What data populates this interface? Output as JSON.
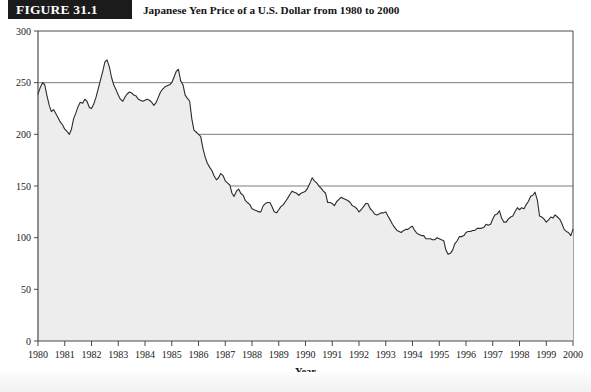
{
  "figure": {
    "label": "FIGURE 31.1",
    "title": "Japanese Yen Price of a U.S. Dollar from 1980 to 2000",
    "label_band_color": "#1b1b1b",
    "label_text_color": "#ffffff"
  },
  "chart_data": {
    "type": "area",
    "title": "Japanese Yen Price of a U.S. Dollar from 1980 to 2000",
    "xlabel": "Year",
    "ylabel": "",
    "xlim": [
      1980,
      2000
    ],
    "ylim": [
      0,
      300
    ],
    "grid": true,
    "gridlines_y": [
      50,
      100,
      150,
      200,
      250
    ],
    "legend": "none",
    "line_color": "#2b2b2b",
    "fill_color": "#ededed",
    "axis_color": "#4a4a4a",
    "yticks": [
      0,
      50,
      100,
      150,
      200,
      250,
      300
    ],
    "ytick_labels": [
      "0",
      "50",
      "100",
      "150",
      "200",
      "250",
      "300"
    ],
    "xticks": [
      1980,
      1981,
      1982,
      1983,
      1984,
      1985,
      1986,
      1987,
      1988,
      1989,
      1990,
      1991,
      1992,
      1993,
      1994,
      1995,
      1996,
      1997,
      1998,
      1999,
      2000
    ],
    "xtick_labels": [
      "1980",
      "1981",
      "1982",
      "1983",
      "1984",
      "1985",
      "1986",
      "1987",
      "1988",
      "1989",
      "1990",
      "1991",
      "1992",
      "1993",
      "1994",
      "1995",
      "1996",
      "1997",
      "1998",
      "1999",
      "2000"
    ],
    "series_name": "Yen per U.S. Dollar",
    "x": [
      1980.0,
      1980.08,
      1980.17,
      1980.25,
      1980.33,
      1980.42,
      1980.5,
      1980.58,
      1980.67,
      1980.75,
      1980.83,
      1980.92,
      1981.0,
      1981.08,
      1981.17,
      1981.25,
      1981.33,
      1981.42,
      1981.5,
      1981.58,
      1981.67,
      1981.75,
      1981.83,
      1981.92,
      1982.0,
      1982.08,
      1982.17,
      1982.25,
      1982.33,
      1982.42,
      1982.5,
      1982.58,
      1982.67,
      1982.75,
      1982.83,
      1982.92,
      1983.0,
      1983.08,
      1983.17,
      1983.25,
      1983.33,
      1983.42,
      1983.5,
      1983.58,
      1983.67,
      1983.75,
      1983.83,
      1983.92,
      1984.0,
      1984.08,
      1984.17,
      1984.25,
      1984.33,
      1984.42,
      1984.5,
      1984.58,
      1984.67,
      1984.75,
      1984.83,
      1984.92,
      1985.0,
      1985.08,
      1985.17,
      1985.25,
      1985.33,
      1985.42,
      1985.5,
      1985.58,
      1985.67,
      1985.75,
      1985.83,
      1985.92,
      1986.0,
      1986.08,
      1986.17,
      1986.25,
      1986.33,
      1986.42,
      1986.5,
      1986.58,
      1986.67,
      1986.75,
      1986.83,
      1986.92,
      1987.0,
      1987.08,
      1987.17,
      1987.25,
      1987.33,
      1987.42,
      1987.5,
      1987.58,
      1987.67,
      1987.75,
      1987.83,
      1987.92,
      1988.0,
      1988.08,
      1988.17,
      1988.25,
      1988.33,
      1988.42,
      1988.5,
      1988.58,
      1988.67,
      1988.75,
      1988.83,
      1988.92,
      1989.0,
      1989.08,
      1989.17,
      1989.25,
      1989.33,
      1989.42,
      1989.5,
      1989.58,
      1989.67,
      1989.75,
      1989.83,
      1989.92,
      1990.0,
      1990.08,
      1990.17,
      1990.25,
      1990.33,
      1990.42,
      1990.5,
      1990.58,
      1990.67,
      1990.75,
      1990.83,
      1990.92,
      1991.0,
      1991.08,
      1991.17,
      1991.25,
      1991.33,
      1991.42,
      1991.5,
      1991.58,
      1991.67,
      1991.75,
      1991.83,
      1991.92,
      1992.0,
      1992.08,
      1992.17,
      1992.25,
      1992.33,
      1992.42,
      1992.5,
      1992.58,
      1992.67,
      1992.75,
      1992.83,
      1992.92,
      1993.0,
      1993.08,
      1993.17,
      1993.25,
      1993.33,
      1993.42,
      1993.5,
      1993.58,
      1993.67,
      1993.75,
      1993.83,
      1993.92,
      1994.0,
      1994.08,
      1994.17,
      1994.25,
      1994.33,
      1994.42,
      1994.5,
      1994.58,
      1994.67,
      1994.75,
      1994.83,
      1994.92,
      1995.0,
      1995.08,
      1995.17,
      1995.25,
      1995.33,
      1995.42,
      1995.5,
      1995.58,
      1995.67,
      1995.75,
      1995.83,
      1995.92,
      1996.0,
      1996.08,
      1996.17,
      1996.25,
      1996.33,
      1996.42,
      1996.5,
      1996.58,
      1996.67,
      1996.75,
      1996.83,
      1996.92,
      1997.0,
      1997.08,
      1997.17,
      1997.25,
      1997.33,
      1997.42,
      1997.5,
      1997.58,
      1997.67,
      1997.75,
      1997.83,
      1997.92,
      1998.0,
      1998.08,
      1998.17,
      1998.25,
      1998.33,
      1998.42,
      1998.5,
      1998.58,
      1998.67,
      1998.75,
      1998.83,
      1998.92,
      1999.0,
      1999.08,
      1999.17,
      1999.25,
      1999.33,
      1999.42,
      1999.5,
      1999.58,
      1999.67,
      1999.75,
      1999.83,
      1999.92,
      2000.0
    ],
    "values": [
      239,
      245,
      250,
      248,
      238,
      228,
      222,
      224,
      220,
      216,
      212,
      209,
      205,
      203,
      200,
      205,
      215,
      221,
      227,
      231,
      230,
      234,
      232,
      226,
      225,
      229,
      236,
      244,
      252,
      261,
      270,
      272,
      265,
      255,
      248,
      243,
      238,
      234,
      232,
      236,
      239,
      241,
      240,
      238,
      237,
      234,
      233,
      232,
      233,
      234,
      233,
      231,
      228,
      231,
      236,
      241,
      244,
      246,
      247,
      248,
      250,
      255,
      261,
      263,
      252,
      248,
      238,
      235,
      232,
      215,
      204,
      202,
      200,
      198,
      186,
      178,
      172,
      168,
      165,
      160,
      156,
      158,
      162,
      160,
      155,
      153,
      151,
      143,
      140,
      145,
      147,
      143,
      141,
      136,
      134,
      132,
      128,
      127,
      126,
      125,
      125,
      131,
      133,
      134,
      134,
      130,
      125,
      124,
      127,
      130,
      132,
      135,
      138,
      142,
      145,
      144,
      143,
      141,
      143,
      144,
      145,
      148,
      153,
      158,
      155,
      153,
      150,
      148,
      145,
      143,
      134,
      134,
      133,
      131,
      135,
      137,
      139,
      138,
      137,
      136,
      134,
      131,
      130,
      128,
      125,
      127,
      130,
      133,
      133,
      128,
      126,
      123,
      122,
      123,
      124,
      124,
      125,
      121,
      117,
      113,
      110,
      107,
      106,
      105,
      107,
      108,
      108,
      110,
      111,
      107,
      104,
      103,
      102,
      102,
      99,
      99,
      99,
      98,
      98,
      100,
      99,
      98,
      97,
      88,
      84,
      85,
      88,
      94,
      97,
      101,
      101,
      102,
      105,
      106,
      106,
      107,
      107,
      109,
      109,
      109,
      110,
      113,
      112,
      113,
      118,
      122,
      123,
      126,
      119,
      115,
      115,
      118,
      120,
      121,
      125,
      129,
      127,
      129,
      128,
      132,
      135,
      140,
      141,
      144,
      136,
      121,
      120,
      118,
      115,
      117,
      120,
      119,
      122,
      120,
      118,
      114,
      108,
      106,
      105,
      102,
      108
    ]
  }
}
